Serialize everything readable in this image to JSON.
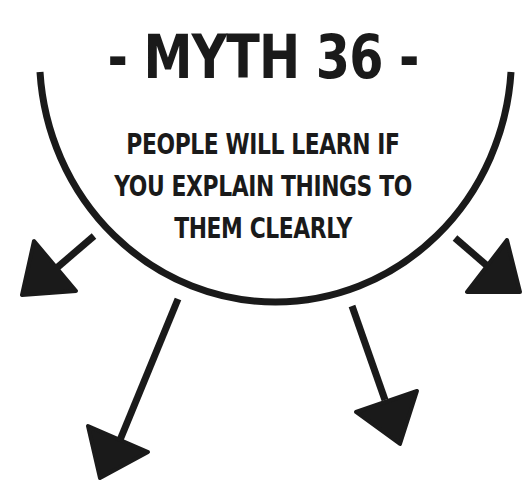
{
  "title": "- MYTH 36 -",
  "subtitle": {
    "lines": [
      "PEOPLE WILL LEARN IF",
      "YOU EXPLAIN THINGS TO",
      "THEM CLEARLY"
    ]
  },
  "graphic": {
    "ink_color": "#1a1a1a",
    "background_color": "#ffffff",
    "arc": "semicircle-open-top",
    "arrows": [
      "arrow-lower-left",
      "arrow-bottom-left",
      "arrow-bottom-right",
      "arrow-lower-right"
    ]
  }
}
